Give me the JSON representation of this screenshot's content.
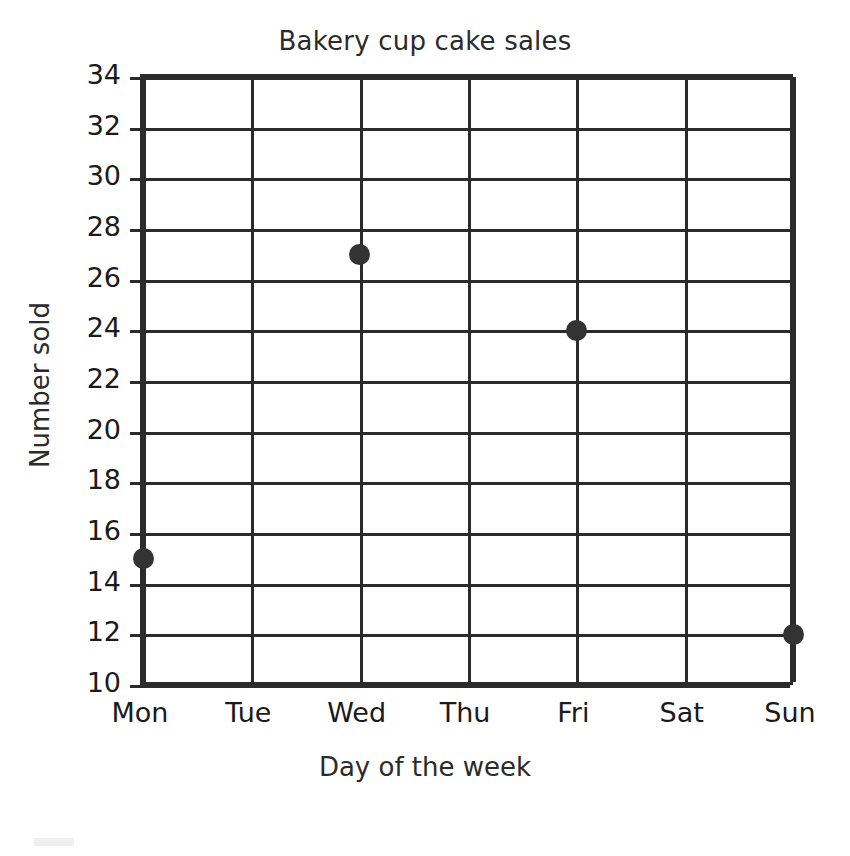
{
  "chart_data": {
    "type": "scatter",
    "title": "Bakery cup cake sales",
    "xlabel": "Day of the week",
    "ylabel": "Number sold",
    "categories": [
      "Mon",
      "Tue",
      "Wed",
      "Thu",
      "Fri",
      "Sat",
      "Sun"
    ],
    "values": [
      15,
      null,
      27,
      null,
      24,
      null,
      12
    ],
    "points": [
      {
        "x": "Mon",
        "y": 15
      },
      {
        "x": "Wed",
        "y": 27
      },
      {
        "x": "Fri",
        "y": 24
      },
      {
        "x": "Sun",
        "y": 12
      }
    ],
    "ylim": [
      10,
      34
    ],
    "ytick_step": 2,
    "yticks": [
      10,
      12,
      14,
      16,
      18,
      20,
      22,
      24,
      26,
      28,
      30,
      32,
      34
    ],
    "grid": true,
    "legend": false,
    "marker_color": "#333333",
    "axis_color": "#2b2b2b"
  }
}
